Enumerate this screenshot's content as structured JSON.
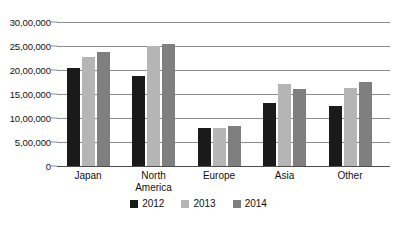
{
  "chart_data": {
    "type": "bar",
    "title": "",
    "subtitle": "",
    "xlabel": "",
    "ylabel": "",
    "categories": [
      "Japan",
      "North America",
      "Europe",
      "Asia",
      "Other"
    ],
    "category_labels_multiline": [
      "Japan",
      "North\nAmerica",
      "Europe",
      "Asia",
      "Other"
    ],
    "series": [
      {
        "name": "2012",
        "color": "#1a1a1a",
        "values": [
          2050000,
          1875000,
          800000,
          1310000,
          1250000
        ]
      },
      {
        "name": "2013",
        "color": "#b5b5b5",
        "values": [
          2275000,
          2500000,
          800000,
          1700000,
          1625000
        ]
      },
      {
        "name": "2014",
        "color": "#7f7f7f",
        "values": [
          2375000,
          2540000,
          830000,
          1600000,
          1750000
        ]
      }
    ],
    "ylim": [
      0,
      3000000
    ],
    "ytick_values": [
      0,
      500000,
      1000000,
      1500000,
      2000000,
      2500000,
      3000000
    ],
    "ytick_labels": [
      "0",
      "5,00,000",
      "10,00,000",
      "15,00,000",
      "20,00,000",
      "25,00,000",
      "30,00,000"
    ],
    "grid": true,
    "grid_axis": "y",
    "legend_position": "bottom",
    "legend_entries": [
      "2012",
      "2013",
      "2014"
    ]
  },
  "colors": {
    "background": "#ffffff",
    "gridline": "#8c8c8c",
    "axis": "#4d4d4d",
    "text": "#111111",
    "series_2012": "#1a1a1a",
    "series_2013": "#b5b5b5",
    "series_2014": "#7f7f7f"
  }
}
